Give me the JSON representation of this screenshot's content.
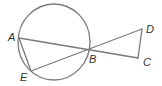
{
  "diagram": {
    "type": "geometry",
    "colors": {
      "stroke": "#7a7a7a",
      "label": "#333333",
      "background": "#ffffff"
    },
    "circle": {
      "cx": 54,
      "cy": 42,
      "rx": 36,
      "ry": 38
    },
    "points": {
      "A": {
        "x": 19,
        "y": 38,
        "label": "A",
        "lx": 8,
        "ly": 41
      },
      "E": {
        "x": 31,
        "y": 71,
        "label": "E",
        "lx": 20,
        "ly": 81
      },
      "B": {
        "x": 88,
        "y": 50,
        "label": "B",
        "lx": 89,
        "ly": 63
      },
      "C": {
        "x": 138,
        "y": 58,
        "label": "C",
        "lx": 143,
        "ly": 66
      },
      "D": {
        "x": 142,
        "y": 29,
        "label": "D",
        "lx": 146,
        "ly": 33
      }
    },
    "segments": [
      [
        "A",
        "C"
      ],
      [
        "E",
        "D"
      ],
      [
        "A",
        "E"
      ],
      [
        "D",
        "C"
      ]
    ]
  }
}
